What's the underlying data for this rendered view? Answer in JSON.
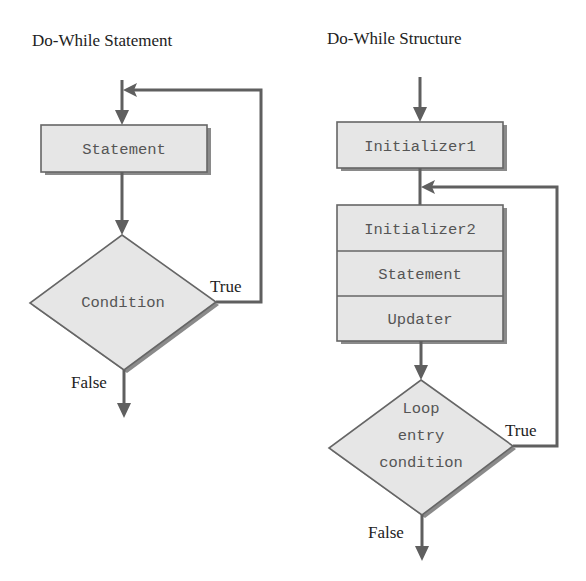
{
  "diagrams": [
    {
      "title": "Do-While Statement",
      "nodes": {
        "statement": "Statement",
        "condition": "Condition"
      },
      "edge_labels": {
        "true": "True",
        "false": "False"
      }
    },
    {
      "title": "Do-While Structure",
      "nodes": {
        "initializer1": "Initializer1",
        "initializer2": "Initializer2",
        "statement": "Statement",
        "updater": "Updater",
        "condition_line1": "Loop",
        "condition_line2": "entry",
        "condition_line3": "condition"
      },
      "edge_labels": {
        "true": "True",
        "false": "False"
      }
    }
  ],
  "colors": {
    "box_fill": "#e6e6e6",
    "line": "#5f5f5f",
    "text": "#222222"
  }
}
